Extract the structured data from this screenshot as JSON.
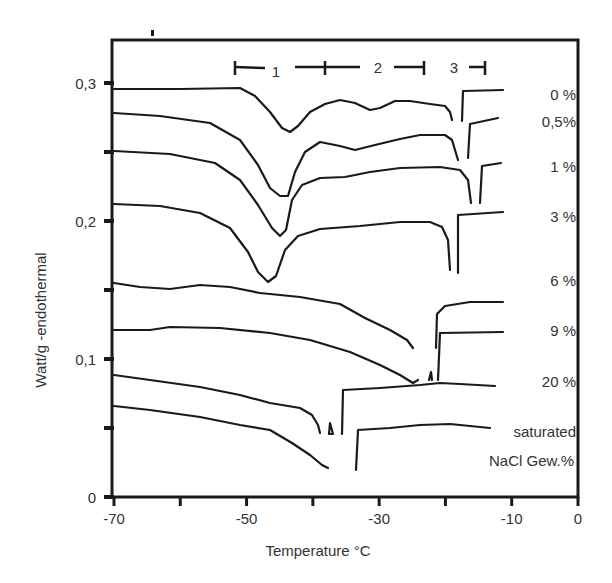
{
  "chart_data": {
    "type": "line",
    "title": "",
    "xlabel": "Temperature °C",
    "ylabel": "Watt/g -endothermal",
    "xlim": [
      -70,
      0
    ],
    "ylim": [
      0,
      0.33
    ],
    "x_ticks": [
      -70,
      -60,
      -50,
      -40,
      -30,
      -20,
      -10,
      0
    ],
    "x_tick_labels": [
      "-70",
      "",
      "-50",
      "",
      "-30",
      "",
      "-10",
      "0"
    ],
    "y_ticks": [
      0,
      0.05,
      0.1,
      0.15,
      0.2,
      0.25,
      0.3
    ],
    "y_tick_labels": [
      "0",
      "",
      "0,1",
      "",
      "0,2",
      "",
      "0,3"
    ],
    "grid": false,
    "legend_position": "right, inline labels",
    "annotations": {
      "ranges": [
        {
          "label": "1",
          "x_from": -52,
          "x_to": -38
        },
        {
          "label": "2",
          "x_from": -38,
          "x_to": -23
        },
        {
          "label": "3",
          "x_from": -23,
          "x_to": -13
        }
      ],
      "legend_caption_line1": "saturated",
      "legend_caption_line2": "NaCl Gew.%"
    },
    "series": [
      {
        "name": "0 %",
        "label_pos": [
          552,
          100
        ],
        "segments": [
          [
            [
              114,
              89
            ],
            [
              180,
              89
            ],
            [
              240,
              88
            ],
            [
              255,
              96
            ],
            [
              270,
              112
            ],
            [
              282,
              128
            ],
            [
              290,
              132
            ],
            [
              298,
              126
            ],
            [
              310,
              112
            ],
            [
              325,
              104
            ],
            [
              340,
              100
            ],
            [
              355,
              103
            ],
            [
              370,
              110
            ],
            [
              380,
              108
            ],
            [
              395,
              101
            ],
            [
              410,
              101
            ],
            [
              430,
              104
            ],
            [
              445,
              106
            ],
            [
              450,
              112
            ],
            [
              452,
              120
            ]
          ],
          [
            [
              462,
              121
            ],
            [
              463,
              91
            ],
            [
              503,
              90
            ]
          ]
        ]
      },
      {
        "name": "0,5%",
        "label_pos": [
          550,
          127
        ],
        "segments": [
          [
            [
              114,
              113
            ],
            [
              160,
              116
            ],
            [
              210,
              123
            ],
            [
              240,
              140
            ],
            [
              258,
              165
            ],
            [
              270,
              188
            ],
            [
              280,
              196
            ],
            [
              288,
              196
            ],
            [
              295,
              172
            ],
            [
              305,
              152
            ],
            [
              320,
              142
            ],
            [
              340,
              146
            ],
            [
              355,
              150
            ],
            [
              375,
              145
            ],
            [
              400,
              139
            ],
            [
              420,
              135
            ],
            [
              445,
              135
            ],
            [
              452,
              140
            ],
            [
              458,
              160
            ]
          ],
          [
            [
              468,
              158
            ],
            [
              470,
              124
            ],
            [
              498,
              118
            ]
          ]
        ]
      },
      {
        "name": "1 %",
        "label_pos": [
          548,
          172
        ],
        "segments": [
          [
            [
              114,
              151
            ],
            [
              170,
              154
            ],
            [
              215,
              163
            ],
            [
              240,
              180
            ],
            [
              258,
              205
            ],
            [
              272,
              228
            ],
            [
              280,
              236
            ],
            [
              286,
              230
            ],
            [
              292,
              200
            ],
            [
              302,
              185
            ],
            [
              320,
              178
            ],
            [
              345,
              177
            ],
            [
              370,
              172
            ],
            [
              400,
              168
            ],
            [
              440,
              167
            ],
            [
              460,
              170
            ],
            [
              468,
              180
            ],
            [
              471,
              203
            ]
          ],
          [
            [
              480,
              203
            ],
            [
              482,
              166
            ],
            [
              501,
              163
            ]
          ]
        ]
      },
      {
        "name": "3 %",
        "label_pos": [
          548,
          222
        ],
        "segments": [
          [
            [
              114,
              204
            ],
            [
              160,
              206
            ],
            [
              200,
              213
            ],
            [
              230,
              228
            ],
            [
              248,
              252
            ],
            [
              258,
              272
            ],
            [
              268,
              282
            ],
            [
              276,
              276
            ],
            [
              285,
              250
            ],
            [
              298,
              236
            ],
            [
              320,
              229
            ],
            [
              360,
              226
            ],
            [
              400,
              222
            ],
            [
              430,
              222
            ],
            [
              442,
              227
            ],
            [
              448,
              240
            ],
            [
              450,
              270
            ]
          ],
          [
            [
              458,
              273
            ],
            [
              458,
              215
            ],
            [
              503,
              212
            ]
          ]
        ]
      },
      {
        "name": "6 %",
        "label_pos": [
          548,
          286
        ],
        "segments": [
          [
            [
              114,
              283
            ],
            [
              140,
              287
            ],
            [
              170,
              289
            ],
            [
              200,
              285
            ],
            [
              230,
              287
            ],
            [
              260,
              293
            ],
            [
              300,
              297
            ],
            [
              340,
              304
            ],
            [
              365,
              318
            ],
            [
              390,
              330
            ],
            [
              407,
              340
            ],
            [
              413,
              348
            ]
          ],
          [
            [
              436,
              348
            ],
            [
              437,
              314
            ],
            [
              445,
              306
            ],
            [
              470,
              302
            ],
            [
              503,
              302
            ]
          ]
        ]
      },
      {
        "name": "9 %",
        "label_pos": [
          548,
          336
        ],
        "segments": [
          [
            [
              114,
              330
            ],
            [
              150,
              330
            ],
            [
              170,
              327
            ],
            [
              220,
              328
            ],
            [
              270,
              333
            ],
            [
              310,
              340
            ],
            [
              350,
              352
            ],
            [
              380,
              365
            ],
            [
              400,
              375
            ],
            [
              413,
              383
            ],
            [
              418,
              380
            ]
          ],
          [
            [
              429,
              380
            ],
            [
              431,
              372
            ],
            [
              432,
              380
            ]
          ],
          [
            [
              438,
              380
            ],
            [
              440,
              333
            ],
            [
              503,
              332
            ]
          ]
        ]
      },
      {
        "name": "20 %",
        "label_pos": [
          548,
          387
        ],
        "segments": [
          [
            [
              114,
              375
            ],
            [
              150,
              380
            ],
            [
              200,
              387
            ],
            [
              240,
              395
            ],
            [
              270,
              403
            ],
            [
              300,
              408
            ],
            [
              312,
              415
            ],
            [
              318,
              425
            ],
            [
              320,
              433
            ]
          ],
          [
            [
              329,
              434
            ],
            [
              330,
              423
            ],
            [
              333,
              434
            ],
            [
              329,
              434
            ]
          ],
          [
            [
              342,
              434
            ],
            [
              343,
              390
            ],
            [
              380,
              388
            ],
            [
              420,
              385
            ],
            [
              440,
              383
            ],
            [
              460,
              384
            ],
            [
              495,
              386
            ]
          ]
        ]
      },
      {
        "name": "saturated NaCl Gew.%",
        "label_pos": [
          576,
          437
        ],
        "segments": [
          [
            [
              114,
              406
            ],
            [
              150,
              410
            ],
            [
              200,
              417
            ],
            [
              240,
              425
            ],
            [
              270,
              430
            ],
            [
              292,
              443
            ],
            [
              310,
              455
            ],
            [
              322,
              465
            ],
            [
              328,
              468
            ]
          ],
          [
            [
              356,
              470
            ],
            [
              358,
              430
            ],
            [
              390,
              428
            ],
            [
              420,
              425
            ],
            [
              450,
              424
            ],
            [
              490,
              428
            ]
          ]
        ]
      }
    ]
  },
  "figure": {
    "x_axis_title": "Temperature °C",
    "y_axis_title": "Watt/g -endothermal",
    "range_labels": [
      "1",
      "2",
      "3"
    ],
    "series_labels": [
      "0 %",
      "0,5%",
      "1 %",
      "3 %",
      "6 %",
      "9 %",
      "20 %"
    ],
    "caption_line1": "saturated",
    "caption_line2": "NaCl Gew.%"
  }
}
